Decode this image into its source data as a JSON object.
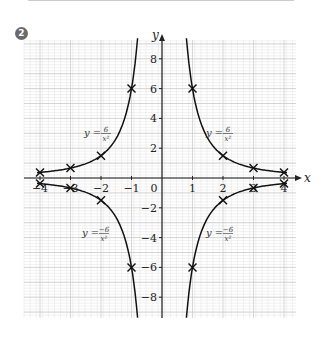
{
  "badge": "2",
  "chart_data": {
    "type": "line",
    "title": "",
    "xlabel": "x",
    "ylabel": "y",
    "xlim": [
      -4,
      4
    ],
    "ylim": [
      -9,
      9
    ],
    "grid": true,
    "x_ticks": [
      -4,
      -3,
      -2,
      -1,
      0,
      1,
      2,
      3,
      4
    ],
    "x_tick_labels": [
      "−4",
      "−3",
      "−2",
      "−1",
      "0",
      "1",
      "2",
      "3",
      "4"
    ],
    "y_ticks": [
      -8,
      -6,
      -4,
      -2,
      2,
      4,
      6,
      8
    ],
    "y_tick_labels": [
      "−8",
      "−6",
      "−4",
      "−2",
      "2",
      "4",
      "6",
      "8"
    ],
    "series": [
      {
        "name": "y = 6/x²",
        "label": "y = 6/x²",
        "points": [
          [
            -4,
            0.375
          ],
          [
            -3,
            0.667
          ],
          [
            -2,
            1.5
          ],
          [
            -1,
            6
          ],
          [
            1,
            6
          ],
          [
            2,
            1.5
          ],
          [
            3,
            0.667
          ],
          [
            4,
            0.375
          ]
        ]
      },
      {
        "name": "y = −6/x²",
        "label": "y = −6/x²",
        "points": [
          [
            -4,
            -0.375
          ],
          [
            -3,
            -0.667
          ],
          [
            -2,
            -1.5
          ],
          [
            -1,
            -6
          ],
          [
            1,
            -6
          ],
          [
            2,
            -1.5
          ],
          [
            3,
            -0.667
          ],
          [
            4,
            -0.375
          ]
        ]
      }
    ],
    "annotations": [
      {
        "text": "y = 6/x²",
        "pos": [
          -2.5,
          2.5
        ]
      },
      {
        "text": "y = 6/x²",
        "pos": [
          2.0,
          2.5
        ]
      },
      {
        "text": "y = −6/x²",
        "pos": [
          -2.5,
          -5
        ]
      },
      {
        "text": "y = −6/x²",
        "pos": [
          2.0,
          -5
        ]
      }
    ]
  },
  "labels": {
    "x_axis": "x",
    "y_axis": "y",
    "eq_pos_left": "y =",
    "eq_pos_right": "y =",
    "eq_neg_left": "y =",
    "eq_neg_right": "y =",
    "num_pos": "6",
    "num_neg": "−6",
    "den": "x²"
  }
}
